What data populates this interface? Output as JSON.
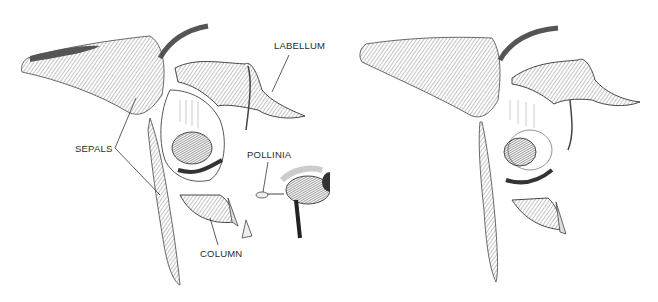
{
  "figure": {
    "panels": [
      {
        "id": "left",
        "description": "Orchid flower cross-section with bee trapped inside and a bee carrying pollinia flying away",
        "labels": [
          {
            "key": "labellum",
            "text": "LABELLUM"
          },
          {
            "key": "sepals",
            "text": "SEPALS"
          },
          {
            "key": "pollinia",
            "text": "POLLINIA"
          },
          {
            "key": "column",
            "text": "COLUMN"
          }
        ]
      },
      {
        "id": "right",
        "description": "Same orchid flower without labels, bee inside the labellum",
        "labels": []
      }
    ],
    "colors": {
      "ink": "#2a2a2a",
      "shade": "#8a8a8a",
      "light": "#cfcfcf",
      "background": "#ffffff"
    }
  }
}
